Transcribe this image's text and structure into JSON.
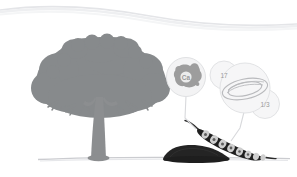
{
  "scene": {
    "title": "Tree and seed pod nutrient illustration",
    "background_color": "#ffffff"
  },
  "horizon": {
    "name": "background-hill-curve",
    "color": "#e2e3e6"
  },
  "ground": {
    "name": "ground-line",
    "color": "#c9cacd"
  },
  "tree": {
    "label": "tree-silhouette",
    "color": "#878a8c",
    "trunk_color": "#8c8e90"
  },
  "soil_mound": {
    "label": "soil-mound",
    "color": "#242424"
  },
  "seed_pod": {
    "label": "seed-pod",
    "pod_color": "#1f1f1f",
    "seed_color": "#cfcfcf",
    "seed_count": 8
  },
  "callouts": {
    "mineral_bubble": {
      "name": "mineral-callout",
      "symbol": "Ca",
      "blob_color": "#9d9d9d",
      "bubble_color": "#f2f2f3",
      "bubble_stroke": "#dfe0e2"
    },
    "seed_bubble": {
      "name": "seed-callout",
      "bubble_color": "#f5f5f6",
      "bubble_stroke": "#dfe0e2",
      "seed_outline": "#b9babd"
    },
    "count_label": "17",
    "fraction_label": "1/3"
  },
  "connectors": {
    "name": "callout-connector-lines",
    "color": "#d8d9dc"
  }
}
